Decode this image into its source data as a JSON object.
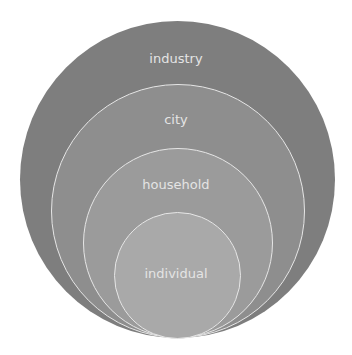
{
  "diagram": {
    "type": "nested-circles",
    "levels": [
      {
        "label": "industry",
        "color": "#7e7e7e"
      },
      {
        "label": "city",
        "color": "#8e8e8e"
      },
      {
        "label": "household",
        "color": "#9b9b9b"
      },
      {
        "label": "individual",
        "color": "#a9a9a9"
      }
    ],
    "stroke_color": "#e6e6e6",
    "label_color": "#e4e4e4"
  }
}
